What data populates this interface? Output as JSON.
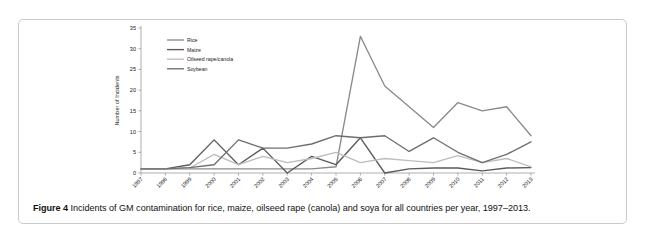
{
  "figure": {
    "caption_label": "Figure 4",
    "caption_text": " Incidents of GM contamination for rice, maize, oilseed rape (canola) and soya for all countries per year, 1997–2013."
  },
  "chart_data": {
    "type": "line",
    "title": "",
    "xlabel": "Year",
    "ylabel": "Number of Incidents",
    "categories": [
      "1997",
      "1998",
      "1999",
      "2000",
      "2001",
      "2002",
      "2003",
      "2004",
      "2005",
      "2006",
      "2007",
      "2008",
      "2009",
      "2010",
      "2011",
      "2012",
      "2013"
    ],
    "ylim": [
      0,
      35
    ],
    "yticks": [
      0,
      5,
      10,
      15,
      20,
      25,
      30,
      35
    ],
    "grid": false,
    "legend_position": "top-left",
    "series": [
      {
        "name": "Rice",
        "color": "#8a8a8a",
        "values": [
          1,
          1,
          1,
          1,
          1,
          1,
          1,
          1,
          1.5,
          33,
          21,
          16,
          11,
          17,
          15,
          16,
          9
        ]
      },
      {
        "name": "Maize",
        "color": "#5a5a5a",
        "values": [
          1,
          1,
          2,
          8,
          2,
          6,
          0,
          4,
          2,
          8.5,
          0,
          1,
          1.2,
          1.2,
          0.5,
          1.2,
          1.3
        ]
      },
      {
        "name": "Oilseed rape/canola",
        "color": "#bdbdbd",
        "values": [
          1,
          1,
          1.2,
          4.5,
          2,
          4,
          2.5,
          3.5,
          5,
          2.5,
          3.5,
          3,
          2.5,
          4.2,
          2.5,
          3.5,
          1.5
        ]
      },
      {
        "name": "Soybean",
        "color": "#6e6e6e",
        "values": [
          1,
          1,
          1.3,
          2,
          8,
          6,
          6,
          7,
          9,
          8.5,
          9,
          5.2,
          8.5,
          5,
          2.5,
          4.5,
          7.5
        ]
      }
    ]
  }
}
